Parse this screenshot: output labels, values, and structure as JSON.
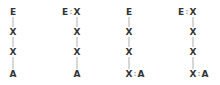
{
  "diagram": {
    "colors": {
      "text": "#333333",
      "bond": "#9a9a9a",
      "background": "#ffffff"
    },
    "structures": [
      {
        "id": 1,
        "nodes": [
          {
            "label": "E",
            "x": 13,
            "y": 15
          },
          {
            "label": "X",
            "x": 13,
            "y": 35
          },
          {
            "label": "X",
            "x": 13,
            "y": 55
          },
          {
            "label": "A",
            "x": 13,
            "y": 77
          }
        ],
        "bonds": [
          {
            "from": 0,
            "to": 1,
            "type": "single"
          },
          {
            "from": 1,
            "to": 2,
            "type": "single"
          },
          {
            "from": 2,
            "to": 3,
            "type": "single"
          }
        ]
      },
      {
        "id": 2,
        "nodes": [
          {
            "label": "E",
            "x": 65,
            "y": 15
          },
          {
            "label": "X",
            "x": 77,
            "y": 15
          },
          {
            "label": "X",
            "x": 77,
            "y": 35
          },
          {
            "label": "X",
            "x": 77,
            "y": 55
          },
          {
            "label": "A",
            "x": 77,
            "y": 77
          }
        ],
        "bonds": [
          {
            "from": 0,
            "to": 1,
            "type": "double"
          },
          {
            "from": 1,
            "to": 2,
            "type": "single"
          },
          {
            "from": 2,
            "to": 3,
            "type": "single"
          },
          {
            "from": 3,
            "to": 4,
            "type": "single"
          }
        ]
      },
      {
        "id": 3,
        "nodes": [
          {
            "label": "E",
            "x": 129,
            "y": 15
          },
          {
            "label": "X",
            "x": 129,
            "y": 35
          },
          {
            "label": "X",
            "x": 129,
            "y": 55
          },
          {
            "label": "X",
            "x": 129,
            "y": 77
          },
          {
            "label": "A",
            "x": 141,
            "y": 77
          }
        ],
        "bonds": [
          {
            "from": 0,
            "to": 1,
            "type": "single"
          },
          {
            "from": 1,
            "to": 2,
            "type": "single"
          },
          {
            "from": 2,
            "to": 3,
            "type": "single"
          },
          {
            "from": 3,
            "to": 4,
            "type": "double"
          }
        ]
      },
      {
        "id": 4,
        "nodes": [
          {
            "label": "E",
            "x": 181,
            "y": 15
          },
          {
            "label": "X",
            "x": 193,
            "y": 15
          },
          {
            "label": "X",
            "x": 193,
            "y": 35
          },
          {
            "label": "X",
            "x": 193,
            "y": 55
          },
          {
            "label": "X",
            "x": 193,
            "y": 77
          },
          {
            "label": "A",
            "x": 205,
            "y": 77
          }
        ],
        "bonds": [
          {
            "from": 0,
            "to": 1,
            "type": "double"
          },
          {
            "from": 1,
            "to": 2,
            "type": "single"
          },
          {
            "from": 2,
            "to": 3,
            "type": "single"
          },
          {
            "from": 3,
            "to": 4,
            "type": "single"
          },
          {
            "from": 4,
            "to": 5,
            "type": "double"
          }
        ]
      }
    ]
  }
}
